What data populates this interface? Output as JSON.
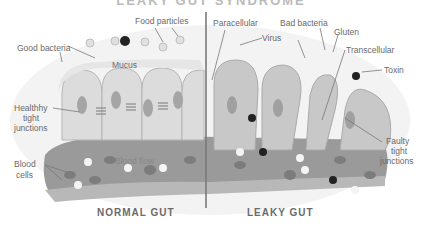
{
  "title": "LEAKY GUT SYNDROME",
  "normal": {
    "heading": "NORMAL GUT",
    "labels": {
      "food_particles": "Food particles",
      "good_bacteria": "Good bacteria",
      "mucus": "Mucus",
      "healthy_tight_junctions_1": "Healthhy",
      "healthy_tight_junctions_2": "tight",
      "healthy_tight_junctions_3": "junctions",
      "blood_cells_1": "Blood",
      "blood_cells_2": "cells",
      "blood_flow": "Blood flow"
    }
  },
  "leaky": {
    "heading": "LEAKY GUT",
    "labels": {
      "paracellular": "Paracellular",
      "bad_bacteria": "Bad bacteria",
      "virus": "Virus",
      "gluten": "Gluten",
      "transcellular": "Transcellular",
      "toxin": "Toxin",
      "faulty_1": "Faulty",
      "faulty_2": "tight",
      "faulty_3": "junctions"
    }
  },
  "colors": {
    "cell": "#d9d9d9",
    "cell_border": "#b5b5b5",
    "nucleus": "#a8a8a8",
    "vessel": "#8f8f8f",
    "vessel_light": "#b3b3b3",
    "divider": "#7a7a7a",
    "toxin": "#222222"
  }
}
